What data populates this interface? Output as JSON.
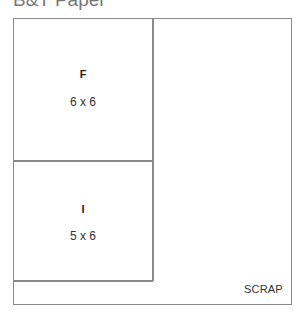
{
  "title": "B&T Paper",
  "pieces": [
    {
      "name": "F",
      "dimensions": "6 x 6"
    },
    {
      "name": "I",
      "dimensions": "5 x 6"
    }
  ],
  "scrap_label": "SCRAP",
  "colors": {
    "line": "#8a8a8a",
    "title": "#777777",
    "text": "#333333"
  }
}
